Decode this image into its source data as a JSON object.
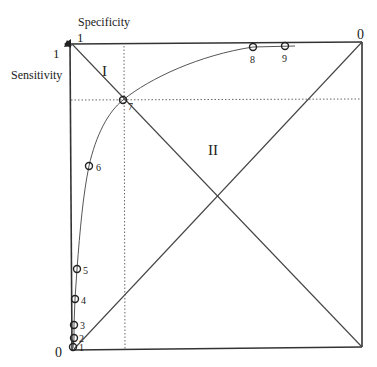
{
  "diagram": {
    "axis_labels": {
      "top": "Specificity",
      "left": "Sensitivity"
    },
    "corner_labels": {
      "top_left_x": "1",
      "top_left_y": "1",
      "top_right": "0",
      "bottom_left": "0"
    },
    "region_labels": [
      "I",
      "II"
    ],
    "points": [
      {
        "label": "1",
        "x": 73,
        "y": 347
      },
      {
        "label": "2",
        "x": 74,
        "y": 338
      },
      {
        "label": "3",
        "x": 74,
        "y": 325
      },
      {
        "label": "4",
        "x": 75,
        "y": 299
      },
      {
        "label": "5",
        "x": 77,
        "y": 269
      },
      {
        "label": "6",
        "x": 89,
        "y": 166
      },
      {
        "label": "7",
        "x": 123,
        "y": 100
      },
      {
        "label": "8",
        "x": 253,
        "y": 47
      },
      {
        "label": "9",
        "x": 285,
        "y": 46
      }
    ],
    "colors": {
      "line": "#333333",
      "background": "#ffffff"
    }
  }
}
